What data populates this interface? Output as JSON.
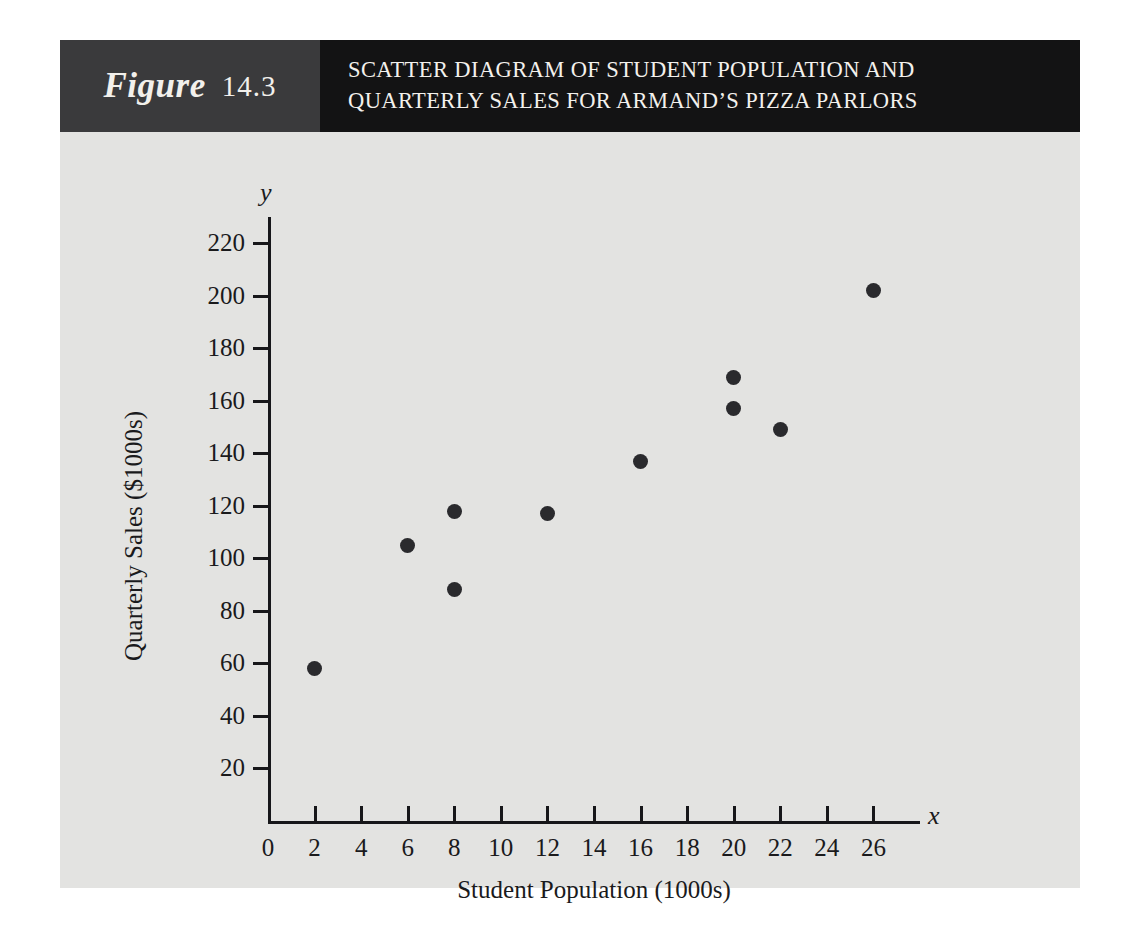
{
  "figure": {
    "label_word": "Figure",
    "number": "14.3",
    "title_line_1": "SCATTER DIAGRAM OF STUDENT POPULATION AND",
    "title_line_2": "QUARTERLY SALES FOR ARMAND’S PIZZA PARLORS",
    "header_bg": "#131314",
    "label_bg": "#3a3a3c",
    "panel_bg": "#e3e3e1"
  },
  "chart_data": {
    "type": "scatter",
    "title": "SCATTER DIAGRAM OF STUDENT POPULATION AND QUARTERLY SALES FOR ARMAND’S PIZZA PARLORS",
    "xlabel": "Student Population (1000s)",
    "ylabel": "Quarterly Sales ($1000s)",
    "x_axis_name": "x",
    "y_axis_name": "y",
    "xlim": [
      0,
      28
    ],
    "ylim": [
      0,
      230
    ],
    "xticks": [
      0,
      2,
      4,
      6,
      8,
      10,
      12,
      14,
      16,
      18,
      20,
      22,
      24,
      26
    ],
    "yticks": [
      20,
      40,
      60,
      80,
      100,
      120,
      140,
      160,
      180,
      200,
      220
    ],
    "xtick_labels": [
      "0",
      "2",
      "4",
      "6",
      "8",
      "10",
      "12",
      "14",
      "16",
      "18",
      "20",
      "22",
      "24",
      "26"
    ],
    "ytick_labels": [
      "20",
      "40",
      "60",
      "80",
      "100",
      "120",
      "140",
      "160",
      "180",
      "200",
      "220"
    ],
    "grid": false,
    "legend": false,
    "marker": "filled-circle",
    "marker_color": "#2a2a2d",
    "x": [
      2,
      6,
      8,
      8,
      12,
      16,
      20,
      20,
      22,
      26
    ],
    "y": [
      58,
      105,
      88,
      118,
      117,
      137,
      157,
      169,
      149,
      202
    ],
    "points": [
      {
        "x": 2,
        "y": 58
      },
      {
        "x": 6,
        "y": 105
      },
      {
        "x": 8,
        "y": 88
      },
      {
        "x": 8,
        "y": 118
      },
      {
        "x": 12,
        "y": 117
      },
      {
        "x": 16,
        "y": 137
      },
      {
        "x": 20,
        "y": 157
      },
      {
        "x": 20,
        "y": 169
      },
      {
        "x": 22,
        "y": 149
      },
      {
        "x": 26,
        "y": 202
      }
    ]
  }
}
